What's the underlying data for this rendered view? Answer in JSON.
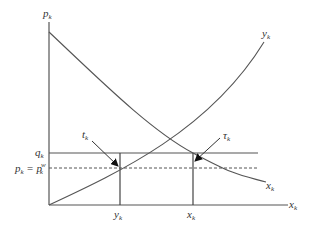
{
  "diagram": {
    "type": "supply-demand",
    "axes": {
      "y_label": "p",
      "y_label_sub": "k",
      "x_label": "x",
      "x_label_sub": "k"
    },
    "curves": {
      "supply": {
        "label": "y",
        "label_sub": "k"
      },
      "demand": {
        "label": "x",
        "label_sub": "k"
      }
    },
    "levels": {
      "q": {
        "label": "q",
        "label_sub": "k",
        "style": "solid"
      },
      "p": {
        "label": "p",
        "label_sub": "k",
        "eq": " = ",
        "label2": "p",
        "label2_sub": "k",
        "label2_sup": "w",
        "style": "dashed"
      }
    },
    "verticals": {
      "y_tick": {
        "label": "y",
        "label_sub": "k"
      },
      "x_tick": {
        "label": "x",
        "label_sub": "k"
      }
    },
    "annotations": {
      "tariff": {
        "label": "t",
        "label_sub": "k"
      },
      "tau": {
        "label": "τ",
        "label_sub": "k"
      }
    },
    "colors": {
      "line": "#555555",
      "text": "#333333",
      "arrow": "#111111"
    }
  }
}
